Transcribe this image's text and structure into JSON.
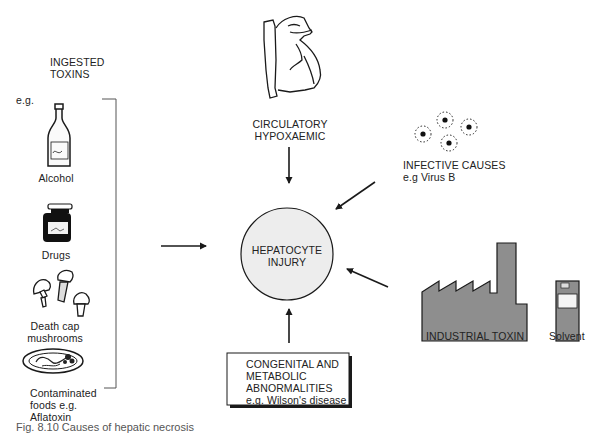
{
  "diagram": {
    "center": {
      "line1": "HEPATOCYTE",
      "line2": "INJURY"
    },
    "ingested": {
      "title1": "INGESTED",
      "title2": "TOXINS",
      "eg": "e.g.",
      "items": [
        {
          "label1": "Alcohol",
          "icon": "bottle-icon"
        },
        {
          "label1": "Drugs",
          "icon": "medicine-jar-icon"
        },
        {
          "label1": "Death cap",
          "label2": "mushrooms",
          "icon": "mushrooms-icon"
        },
        {
          "label1": "Contaminated",
          "label2": "foods e.g.",
          "label3": "Aflatoxin",
          "icon": "food-plate-icon"
        }
      ]
    },
    "circulatory": {
      "line1": "CIRCULATORY",
      "line2": "HYPOXAEMIC",
      "icon": "heart-icon"
    },
    "infective": {
      "line1": "INFECTIVE CAUSES",
      "line2": "e.g  Virus B",
      "icon": "virus-icon"
    },
    "industrial": {
      "label": "INDUSTRIAL TOXIN",
      "icon": "factory-icon"
    },
    "solvent": {
      "label": "Solvent",
      "icon": "solvent-can-icon"
    },
    "congenital": {
      "line1": "CONGENITAL AND",
      "line2": "METABOLIC",
      "line3": "ABNORMALITIES",
      "line4": "e.g. Wilson's disease"
    },
    "caption": "Fig. 8.10  Causes of hepatic necrosis"
  },
  "colors": {
    "circle_fill": "#ededed",
    "factory_fill": "#8e8e8e",
    "stroke": "#1a1a1a"
  }
}
